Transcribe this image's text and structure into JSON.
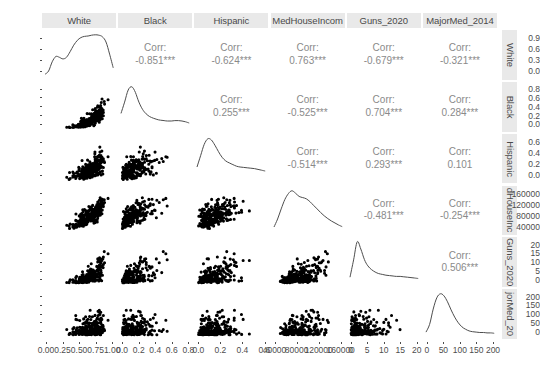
{
  "chart_data": {
    "type": "scatter",
    "plot_kind": "scatterplot-matrix",
    "title": "",
    "variables": [
      "White",
      "Black",
      "Hispanic",
      "MedHouseIncome",
      "Guns_2020",
      "MajorMed_2014"
    ],
    "column_headers": [
      "White",
      "Black",
      "Hispanic",
      "MedHouseIncom",
      "Guns_2020",
      "MajorMed_2014"
    ],
    "row_headers": [
      "White",
      "Black",
      "Hispanic",
      "dHouseInc",
      "Guns_2020",
      "jorMed_20"
    ],
    "upper_panel_style": "correlation-text",
    "diagonal_style": "density-curve",
    "lower_panel_style": "scatter-points",
    "significance_note": "*** denotes p < 0.001",
    "corr_prefix": "Corr:",
    "correlations": [
      {
        "row": "White",
        "col": "Black",
        "value": "-0.851***"
      },
      {
        "row": "White",
        "col": "Hispanic",
        "value": "-0.624***"
      },
      {
        "row": "White",
        "col": "MedHouseIncome",
        "value": "0.763***"
      },
      {
        "row": "White",
        "col": "Guns_2020",
        "value": "-0.679***"
      },
      {
        "row": "White",
        "col": "MajorMed_2014",
        "value": "-0.321***"
      },
      {
        "row": "Black",
        "col": "Hispanic",
        "value": "0.255***"
      },
      {
        "row": "Black",
        "col": "MedHouseIncome",
        "value": "-0.525***"
      },
      {
        "row": "Black",
        "col": "Guns_2020",
        "value": "0.704***"
      },
      {
        "row": "Black",
        "col": "MajorMed_2014",
        "value": "0.284***"
      },
      {
        "row": "Hispanic",
        "col": "MedHouseIncome",
        "value": "-0.514***"
      },
      {
        "row": "Hispanic",
        "col": "Guns_2020",
        "value": "0.293***"
      },
      {
        "row": "Hispanic",
        "col": "MajorMed_2014",
        "value": "0.101"
      },
      {
        "row": "MedHouseIncome",
        "col": "Guns_2020",
        "value": "-0.481***"
      },
      {
        "row": "MedHouseIncome",
        "col": "MajorMed_2014",
        "value": "-0.254***"
      },
      {
        "row": "Guns_2020",
        "col": "MajorMed_2014",
        "value": "0.506***"
      }
    ],
    "y_axes": [
      {
        "variable": "White",
        "ticks": [
          "0.9",
          "0.6",
          "0.3",
          "0.0"
        ],
        "range": [
          0.0,
          1.0
        ]
      },
      {
        "variable": "Black",
        "ticks": [
          "0.8",
          "0.6",
          "0.4",
          "0.2",
          "0.0"
        ],
        "range": [
          0.0,
          0.9
        ]
      },
      {
        "variable": "Hispanic",
        "ticks": [
          "0.6",
          "0.4",
          "0.2",
          "0.0"
        ],
        "range": [
          0.0,
          0.7
        ]
      },
      {
        "variable": "MedHouseIncome",
        "ticks": [
          "160000",
          "120000",
          "80000",
          "40000"
        ],
        "range": [
          20000,
          175000
        ]
      },
      {
        "variable": "Guns_2020",
        "ticks": [
          "20",
          "15",
          "10",
          "5",
          "0"
        ],
        "range": [
          0,
          23
        ]
      },
      {
        "variable": "MajorMed_2014",
        "ticks": [
          "200",
          "150",
          "100",
          "50",
          "0"
        ],
        "range": [
          0,
          230
        ]
      }
    ],
    "x_axes": [
      {
        "variable": "White",
        "ticks": [
          "0.00",
          "0.25",
          "0.50",
          "0.75",
          "1.00"
        ],
        "range": [
          0.0,
          1.0
        ]
      },
      {
        "variable": "Black",
        "ticks": [
          "0.0",
          "0.2",
          "0.4",
          "0.6",
          "0.8"
        ],
        "range": [
          0.0,
          0.9
        ]
      },
      {
        "variable": "Hispanic",
        "ticks": [
          "0.0",
          "0.2",
          "0.4",
          "0.6"
        ],
        "range": [
          0.0,
          0.7
        ]
      },
      {
        "variable": "MedHouseIncome",
        "ticks": [
          "40000",
          "80000",
          "120000",
          "160000"
        ],
        "range": [
          20000,
          175000
        ]
      },
      {
        "variable": "Guns_2020",
        "ticks": [
          "0",
          "5",
          "10",
          "15",
          "20"
        ],
        "range": [
          0,
          23
        ]
      },
      {
        "variable": "MajorMed_2014",
        "ticks": [
          "0",
          "50",
          "100",
          "150",
          "200"
        ],
        "range": [
          0,
          230
        ]
      }
    ],
    "colors": {
      "point": "#000000",
      "density_line": "#4d4d4d",
      "strip_background": "#e9e9e9",
      "strip_text": "#4a4a4a",
      "corr_text": "#8a8a8a",
      "axis_text": "#4d4d4d",
      "panel_background": "#ffffff"
    },
    "densities": {
      "White": [
        0.02,
        0.1,
        0.33,
        0.46,
        0.44,
        0.4,
        0.44,
        0.58,
        0.74,
        0.86,
        0.93,
        0.96,
        0.97,
        0.99,
        1.0,
        0.99,
        0.95,
        0.82,
        0.52,
        0.18
      ],
      "Black": [
        0.34,
        0.62,
        0.92,
        1.0,
        0.86,
        0.62,
        0.44,
        0.33,
        0.26,
        0.22,
        0.19,
        0.17,
        0.16,
        0.15,
        0.15,
        0.16,
        0.16,
        0.15,
        0.13,
        0.1
      ],
      "Hispanic": [
        0.3,
        0.58,
        0.86,
        1.0,
        0.97,
        0.84,
        0.68,
        0.54,
        0.45,
        0.4,
        0.36,
        0.32,
        0.3,
        0.29,
        0.28,
        0.27,
        0.26,
        0.24,
        0.22,
        0.2
      ],
      "MedHouseIncome": [
        0.1,
        0.3,
        0.55,
        0.78,
        0.93,
        1.0,
        0.94,
        0.86,
        0.83,
        0.8,
        0.73,
        0.64,
        0.55,
        0.46,
        0.38,
        0.31,
        0.25,
        0.2,
        0.15,
        0.11
      ],
      "Guns_2020": [
        0.12,
        0.55,
        1.0,
        0.82,
        0.56,
        0.4,
        0.31,
        0.25,
        0.21,
        0.19,
        0.17,
        0.16,
        0.15,
        0.14,
        0.14,
        0.13,
        0.12,
        0.11,
        0.1,
        0.09
      ],
      "MajorMed_2014": [
        0.05,
        0.24,
        0.62,
        0.9,
        1.0,
        0.95,
        0.8,
        0.6,
        0.42,
        0.28,
        0.18,
        0.12,
        0.08,
        0.06,
        0.05,
        0.04,
        0.04,
        0.03,
        0.03,
        0.02
      ]
    }
  }
}
